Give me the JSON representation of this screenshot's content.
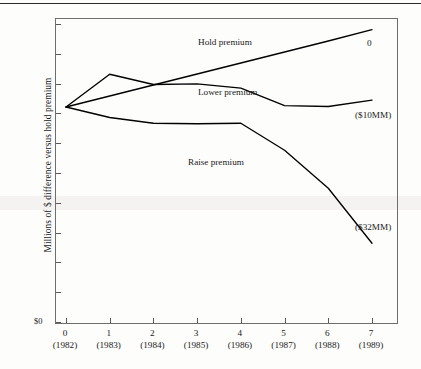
{
  "figure": {
    "y_axis_title": "Millions of $ difference versus hold premium",
    "baseline_label": "$0"
  },
  "chart_data": {
    "type": "line",
    "title": "",
    "xlabel": "",
    "ylabel": "Millions of $ difference versus hold premium",
    "grid": false,
    "legend": "inline-annotations",
    "x": [
      0,
      1,
      2,
      3,
      4,
      5,
      6,
      7
    ],
    "x_tick_numbers": [
      "0",
      "1",
      "2",
      "3",
      "4",
      "5",
      "6",
      "7"
    ],
    "x_tick_years": [
      "(1982)",
      "(1983)",
      "(1984)",
      "(1985)",
      "(1986)",
      "(1987)",
      "(1988)",
      "(1989)"
    ],
    "y_tick_count": 11,
    "baseline_tick_label": "$0",
    "series": [
      {
        "name": "Hold premium",
        "end_label": "0",
        "values": [
          0,
          4.2,
          8.4,
          12.6,
          16.8,
          21.0,
          25.2,
          29.5
        ]
      },
      {
        "name": "Lower premium",
        "end_label": "($10MM)",
        "values": [
          0,
          12.5,
          8.6,
          8.8,
          7.2,
          0.5,
          0.2,
          2.6
        ]
      },
      {
        "name": "Raise premium",
        "end_label": "($32MM)",
        "values": [
          0,
          -4.0,
          -6.2,
          -6.4,
          -6.2,
          -16.5,
          -31.0,
          -52.0
        ]
      }
    ]
  }
}
